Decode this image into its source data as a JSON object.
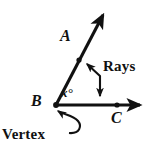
{
  "figure": {
    "kind": "geometry-diagram",
    "background_color": "#ffffff",
    "stroke_color": "#111111",
    "labels": {
      "point_a": "A",
      "point_b": "B",
      "point_c": "C",
      "angle_measure": "x°",
      "rays_callout": "Rays",
      "vertex_callout": "Vertex"
    },
    "geometry": {
      "vertex": {
        "name": "B",
        "x": 56,
        "y": 105
      },
      "points": [
        {
          "name": "A",
          "x": 79,
          "y": 60
        },
        {
          "name": "C",
          "x": 118,
          "y": 105
        }
      ],
      "rays": [
        {
          "name": "ray-BA",
          "from": "B",
          "through": "A",
          "tip_x": 104,
          "tip_y": 13
        },
        {
          "name": "ray-BC",
          "from": "B",
          "through": "C",
          "tip_x": 144,
          "tip_y": 105
        }
      ],
      "angle": {
        "at": "B",
        "between": [
          "ray-BA",
          "ray-BC"
        ],
        "label": "x°"
      }
    },
    "callouts": [
      {
        "name": "rays-callout",
        "text": "Rays",
        "targets": [
          "ray-BA",
          "ray-BC"
        ],
        "arrow_style": "double-headed-bent"
      },
      {
        "name": "vertex-callout",
        "text": "Vertex",
        "targets": [
          "B"
        ],
        "arrow_style": "curved-single-headed"
      }
    ]
  }
}
